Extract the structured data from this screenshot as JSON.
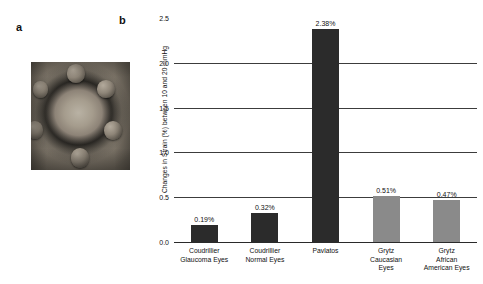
{
  "figure": {
    "panel_a_letter": "a",
    "panel_b_letter": "b",
    "panel_a_caption": ""
  },
  "chart_data": {
    "type": "bar",
    "title": "",
    "xlabel": "",
    "ylabel": "Changes in Strain (%) between 10 and 20 mmHg",
    "ylim": [
      0.0,
      2.5
    ],
    "yticks": [
      "0.0",
      "0.5",
      "1.0",
      "1.5",
      "2.0",
      "2.5"
    ],
    "ytick_values": [
      0.0,
      0.5,
      1.0,
      1.5,
      2.0,
      2.5
    ],
    "gridlines_at": [
      0.5,
      1.0,
      1.5,
      2.0
    ],
    "grid": true,
    "legend": "none",
    "categories": [
      "Coudrillier\nGlaucoma Eyes",
      "Coudrillier\nNormal Eyes",
      "Pavlatos",
      "Grytz\nCaucasian\nEyes",
      "Grytz\nAfrican\nAmerican Eyes"
    ],
    "category_lines": [
      [
        "Coudrillier",
        "Glaucoma Eyes"
      ],
      [
        "Coudrillier",
        "Normal Eyes"
      ],
      [
        "Pavlatos"
      ],
      [
        "Grytz",
        "Caucasian",
        "Eyes"
      ],
      [
        "Grytz",
        "African",
        "American Eyes"
      ]
    ],
    "values": [
      0.19,
      0.32,
      2.38,
      0.51,
      0.47
    ],
    "value_labels": [
      "0.19%",
      "0.32%",
      "2.38%",
      "0.51%",
      "0.47%"
    ],
    "bar_colors": [
      "#2b2b2b",
      "#2b2b2b",
      "#2b2b2b",
      "#8a8a8a",
      "#8a8a8a"
    ]
  },
  "colors": {
    "bar_dark": "#2b2b2b",
    "bar_gray": "#8a8a8a",
    "axis": "#2a2a2a",
    "grid": "#3c3c3c",
    "text": "#111111",
    "background": "#ffffff"
  }
}
